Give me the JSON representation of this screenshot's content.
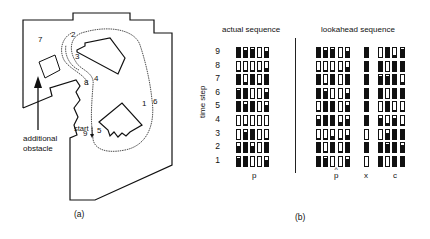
{
  "panel_a": {
    "caption": "(a)",
    "annotation": [
      "additional",
      "obstacle"
    ],
    "start_label": "start",
    "waypoints": [
      {
        "label": "7",
        "x": 38,
        "y": 40
      },
      {
        "label": "2",
        "x": 71,
        "y": 35
      },
      {
        "label": "3",
        "x": 75,
        "y": 57
      },
      {
        "label": "8",
        "x": 84,
        "y": 83
      },
      {
        "label": "4",
        "x": 94,
        "y": 79
      },
      {
        "label": "1",
        "x": 142,
        "y": 104
      },
      {
        "label": "6",
        "x": 153,
        "y": 102
      },
      {
        "label": "9",
        "x": 83,
        "y": 134
      },
      {
        "label": "5",
        "x": 97,
        "y": 131
      }
    ]
  },
  "panel_b": {
    "caption": "(b)",
    "actual_title": "actual sequence",
    "lookahead_title": "lookahead sequence",
    "ylabel": "time step",
    "time_steps": [
      "9",
      "8",
      "7",
      "6",
      "5",
      "4",
      "3",
      "2",
      "1"
    ],
    "actual_xlabel": "p",
    "lookahead_xlabels": {
      "p_hat": "p",
      "x": "x",
      "c": "c"
    },
    "actual": [
      [
        1.0,
        0.8,
        0.9,
        0.0,
        0.7
      ],
      [
        0.1,
        0.1,
        0.1,
        0.1,
        0.3
      ],
      [
        1.0,
        0.2,
        1.0,
        0.1,
        1.0
      ],
      [
        0.9,
        1.0,
        0.0,
        0.0,
        0.7
      ],
      [
        1.0,
        0.8,
        1.0,
        0.0,
        0.7
      ],
      [
        0.0,
        0.1,
        0.0,
        0.0,
        0.0
      ],
      [
        0.0,
        0.7,
        1.0,
        0.0,
        0.1
      ],
      [
        0.7,
        1.0,
        0.7,
        0.0,
        1.0
      ],
      [
        0.9,
        1.0,
        0.0,
        0.0,
        0.7
      ]
    ],
    "lookahead_p": [
      [
        1.0,
        0.8,
        0.9,
        0.0,
        0.7
      ],
      [
        0.1,
        0.1,
        0.1,
        0.1,
        0.4
      ],
      [
        1.0,
        0.1,
        1.0,
        0.0,
        1.0
      ],
      [
        1.0,
        0.8,
        0.0,
        0.0,
        0.5
      ],
      [
        0.2,
        1.0,
        1.0,
        0.0,
        0.7
      ],
      [
        0.7,
        1.0,
        1.0,
        0.3,
        0.7
      ],
      [
        0.1,
        0.1,
        0.3,
        0.1,
        0.4
      ],
      [
        1.0,
        0.1,
        1.0,
        0.1,
        1.0
      ],
      [
        1.0,
        0.9,
        0.0,
        0.0,
        0.8
      ]
    ],
    "lookahead_x": [
      1.0,
      1.0,
      1.0,
      1.0,
      1.0,
      1.0,
      0.0,
      1.0,
      0.0
    ],
    "lookahead_c": [
      [
        0.0,
        1.0,
        0.2,
        0.9
      ],
      [
        1.0,
        0.0,
        1.0,
        1.0
      ],
      [
        0.9,
        0.9,
        1.0,
        0.3
      ],
      [
        1.0,
        0.0,
        1.0,
        1.0
      ],
      [
        0.0,
        1.0,
        0.2,
        0.2
      ],
      [
        0.8,
        0.2,
        0.8,
        0.1
      ],
      [
        0.0,
        0.6,
        1.0,
        1.0
      ],
      [
        1.0,
        0.9,
        1.0,
        0.8
      ],
      [
        1.0,
        0.0,
        1.0,
        1.0
      ]
    ]
  }
}
